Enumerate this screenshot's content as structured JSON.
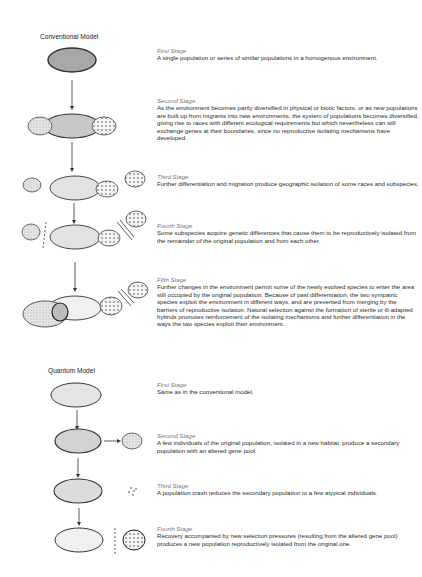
{
  "conventional": {
    "title": "Conventional Model",
    "stages": [
      {
        "name": "First Stage",
        "text": "A single population or series of similar populations in a homogenous environment."
      },
      {
        "name": "Second Stage",
        "text": "As the environment becomes partly diversified in physical or biotic factors, or as new populations are built up from migrants into new environments, the system of populations becomes diversified, giving rise to races with different ecological requirements but which nevertheless can still exchange genes at their boundaries, since no reproductive isolating mechanisms have developed."
      },
      {
        "name": "Third Stage",
        "text": "Further differentiation and migration produce geographic isolation of some races and subspecies."
      },
      {
        "name": "Fourth Stage",
        "text": "Some subspecies acquire genetic differences that cause them to be reproductively isolated from the remainder of the original population and from each other."
      },
      {
        "name": "Fifth Stage",
        "text": "Further changes in the environment permit some of the newly evolved species to enter the area still occupied by the original population. Because of past differentiation, the two sympatric species exploit the environment in different ways, and are prevented from merging by the barriers of reproductive isolation. Natural selection against the formation of sterile or ill-adapted hybrids promotes reinforcement of the isolating mechanisms and further differentiation in the ways the two species exploit their environment."
      }
    ]
  },
  "quantum": {
    "title": "Quantum Model",
    "stages": [
      {
        "name": "First Stage",
        "text": "Same as in the conventional model."
      },
      {
        "name": "Second Stage",
        "text": "A few individuals of the original population, isolated in a new habitat, produce a secondary population with an altered gene pool."
      },
      {
        "name": "Third Stage",
        "text": "A population crash reduces the secondary population to a few atypical individuals."
      },
      {
        "name": "Fourth Stage",
        "text": "Recovery accompanied by new selection pressures (resulting from the altered gene pool) produces a new population reproductively isolated from the original one."
      }
    ]
  }
}
